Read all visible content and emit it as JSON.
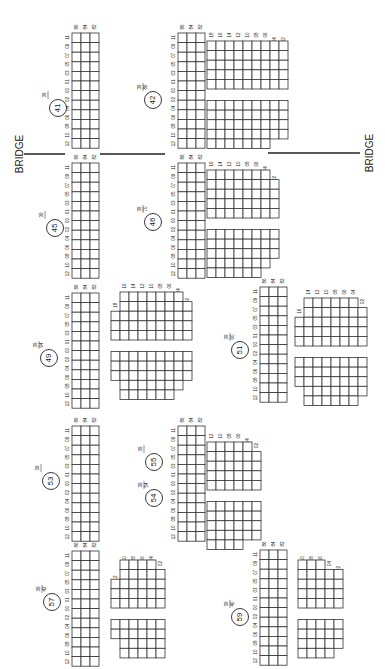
{
  "diagram": {
    "orientation": "rotated-90",
    "bridge_label": "BRIDGE",
    "bridges": [
      {
        "x1": 24,
        "y1": 154,
        "x2": 65,
        "y2": 154
      },
      {
        "x1": 100,
        "y1": 154,
        "x2": 165,
        "y2": 154
      },
      {
        "x1": 268,
        "y1": 153,
        "x2": 360,
        "y2": 153
      }
    ],
    "bridge_labels": [
      {
        "text": "BRIDGE",
        "x": 20,
        "y": 154
      },
      {
        "text": "BRIDGE",
        "x": 370,
        "y": 153
      }
    ],
    "row_col_labels": [
      "86",
      "84",
      "82"
    ],
    "seat_labels": [
      "12",
      "10",
      "08",
      "06",
      "04",
      "02",
      "00",
      "01",
      "03",
      "05",
      "07",
      "09",
      "11"
    ],
    "main_blocks": [
      {
        "section": "41",
        "num": "39",
        "den": "",
        "x": 72,
        "y": 33,
        "cx": 58,
        "cy": 108
      },
      {
        "section": "42",
        "num": "39",
        "den": "86",
        "x": 178,
        "y": 33,
        "cx": 153,
        "cy": 100
      },
      {
        "section": "45",
        "num": "39",
        "den": "",
        "x": 72,
        "y": 163,
        "cx": 55,
        "cy": 228
      },
      {
        "section": "46",
        "num": "39",
        "den": "70",
        "x": 178,
        "y": 163,
        "cx": 153,
        "cy": 222
      },
      {
        "section": "49",
        "num": "39",
        "den": "64",
        "x": 72,
        "y": 293,
        "cx": 49,
        "cy": 358
      },
      {
        "section": "51",
        "num": "39",
        "den": "60",
        "x": 260,
        "y": 287,
        "cx": 240,
        "cy": 350
      },
      {
        "section": "53",
        "num": "39",
        "den": "",
        "x": 72,
        "y": 426,
        "cx": 51,
        "cy": 481
      },
      {
        "section": "54",
        "num": "39",
        "den": "54",
        "x": 178,
        "y": 426,
        "cx": 154,
        "cy": 498
      },
      {
        "section": "55",
        "num": "39",
        "den": "",
        "x": 178,
        "y": 426,
        "cx": 154,
        "cy": 462,
        "nolabel": true
      },
      {
        "section": "57",
        "num": "39",
        "den": "42",
        "x": 72,
        "y": 551,
        "cx": 52,
        "cy": 602
      },
      {
        "section": "59",
        "num": "39",
        "den": "40",
        "x": 260,
        "y": 550,
        "cx": 240,
        "cy": 617
      }
    ],
    "side_blocks": [
      {
        "label": "42-side",
        "x": 207,
        "y": 41,
        "cols": [
          "18",
          "16",
          "14",
          "12",
          "10",
          "08",
          "06",
          "04",
          "02"
        ],
        "shape": [
          10,
          10,
          10,
          10,
          10,
          10,
          10,
          9,
          9
        ],
        "split": 5
      },
      {
        "label": "46-side",
        "x": 207,
        "y": 170,
        "cols": [
          "16",
          "14",
          "12",
          "10",
          "08",
          "06",
          "04",
          "02"
        ],
        "shape": [
          10,
          10,
          10,
          10,
          10,
          10,
          9,
          7
        ],
        "split": 5
      },
      {
        "label": "49-side",
        "x": 111,
        "y": 292,
        "cols": [
          "18",
          "16",
          "14",
          "12",
          "10",
          "08",
          "06",
          "04",
          "02"
        ],
        "shape": [
          6,
          10,
          10,
          10,
          10,
          10,
          10,
          9,
          7
        ],
        "split": 5
      },
      {
        "label": "51-side",
        "x": 295,
        "y": 298,
        "cols": [
          "16",
          "14",
          "12",
          "10",
          "08",
          "06",
          "04",
          "02"
        ],
        "shape": [
          6,
          10,
          10,
          10,
          10,
          10,
          10,
          8
        ],
        "split": 5
      },
      {
        "label": "55-side",
        "x": 207,
        "y": 442,
        "cols": [
          "12",
          "10",
          "08",
          "06",
          "04",
          "02"
        ],
        "shape": [
          10,
          10,
          10,
          10,
          9,
          8
        ],
        "split": 5
      },
      {
        "label": "57-side",
        "x": 111,
        "y": 560,
        "cols": [
          "12",
          "10",
          "08",
          "06",
          "04",
          "02"
        ],
        "shape": [
          5,
          9,
          9,
          9,
          9,
          8
        ],
        "split": 5
      },
      {
        "label": "59-side",
        "x": 298,
        "y": 560,
        "cols": [
          "10",
          "08",
          "06",
          "04",
          "02"
        ],
        "shape": [
          9,
          9,
          9,
          8,
          7
        ],
        "split": 5
      }
    ]
  }
}
